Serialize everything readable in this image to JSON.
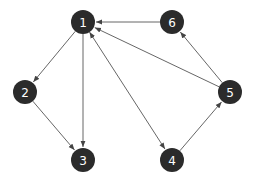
{
  "graph": {
    "type": "directed",
    "node_color": "#2b2b2b",
    "edge_color": "#555555",
    "label_color": "#ffffff",
    "nodes": [
      {
        "id": "1",
        "label": "1",
        "x": 83,
        "y": 22
      },
      {
        "id": "6",
        "label": "6",
        "x": 172,
        "y": 22
      },
      {
        "id": "2",
        "label": "2",
        "x": 25,
        "y": 92
      },
      {
        "id": "5",
        "label": "5",
        "x": 230,
        "y": 92
      },
      {
        "id": "3",
        "label": "3",
        "x": 83,
        "y": 160
      },
      {
        "id": "4",
        "label": "4",
        "x": 172,
        "y": 160
      }
    ],
    "edges": [
      {
        "from": "1",
        "to": "2"
      },
      {
        "from": "1",
        "to": "3"
      },
      {
        "from": "2",
        "to": "3"
      },
      {
        "from": "1",
        "to": "4",
        "bidirectional": true
      },
      {
        "from": "4",
        "to": "5"
      },
      {
        "from": "5",
        "to": "6"
      },
      {
        "from": "5",
        "to": "1"
      },
      {
        "from": "6",
        "to": "1"
      }
    ]
  }
}
